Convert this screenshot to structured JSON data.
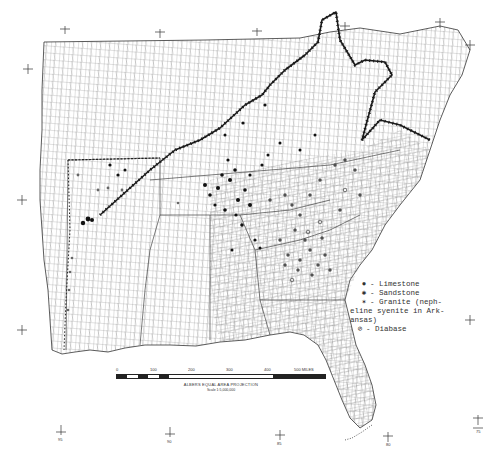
{
  "figure": {
    "type": "county outline map of southeastern United States",
    "legend": {
      "items": [
        {
          "symbol": "filled-circle",
          "label": "- Limestone"
        },
        {
          "symbol": "asterisk-dot",
          "label": "- Sandstone"
        },
        {
          "symbol": "dot-star",
          "label": "- Granite (neph-"
        },
        {
          "symbol": "",
          "label": "eline syenite in Ark-"
        },
        {
          "symbol": "",
          "label": "ansas)"
        },
        {
          "symbol": "circled-slash",
          "label": "- Diabase"
        }
      ]
    },
    "scale_bar": {
      "ticks": [
        "0",
        "100",
        "200",
        "300",
        "400",
        "500 MILES"
      ],
      "projection": "ALBERS EQUAL AREA PROJECTION",
      "scale": "Scale 1:5,000,000"
    },
    "graticule_labels": {
      "bottom": [
        "95",
        "90",
        "85",
        "80",
        "75"
      ],
      "colors": {
        "ink": "#222222",
        "paper": "#ffffff",
        "county_lines": "#555555"
      }
    }
  }
}
